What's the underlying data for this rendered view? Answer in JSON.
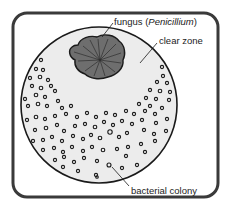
{
  "diagram": {
    "title": "",
    "labels": {
      "fungus_prefix": "fungus (",
      "fungus_genus": "Penicillium",
      "fungus_suffix": ")",
      "clear_zone": "clear zone",
      "bacterial_colony": "bacterial colony"
    },
    "colors": {
      "frame_stroke": "#3a3a3a",
      "plate_fill": "#ececec",
      "plate_stroke": "#1a1a1a",
      "fungus_fill": "#6e6e6e",
      "fungus_stroke": "#1a1a1a",
      "colony_stroke": "#1a1a1a",
      "background": "#ffffff"
    },
    "nodes": [
      {
        "id": "petri-dish",
        "label": ""
      },
      {
        "id": "fungus",
        "label": "fungus (Penicillium)"
      },
      {
        "id": "clear-zone",
        "label": "clear zone"
      },
      {
        "id": "bacterial-colony",
        "label": "bacterial colony"
      }
    ]
  }
}
